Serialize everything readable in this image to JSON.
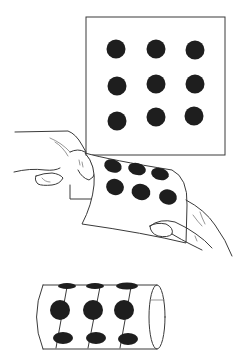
{
  "figure": {
    "panels": [
      {
        "id": "flat-sheet",
        "description": "Square sheet with 3x3 grid of dots",
        "rows": 3,
        "cols": 3,
        "dot_count": 9
      },
      {
        "id": "bending-sheet",
        "description": "Hands bending the dotted sheet",
        "visible_dots": 6
      },
      {
        "id": "cylinder",
        "description": "Sheet rolled into a cylinder with dots",
        "visible_dot_rows": 3,
        "visible_dot_cols": 3
      }
    ],
    "colors": {
      "ink": "#1e1e1e",
      "line": "#3a3a3a",
      "background": "#ffffff"
    }
  }
}
